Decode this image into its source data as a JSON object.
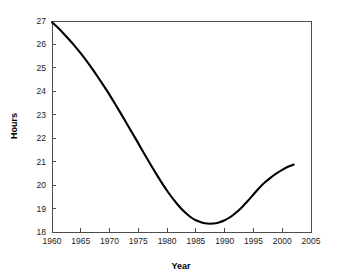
{
  "chart_data": {
    "type": "line",
    "title": "",
    "xlabel": "Year",
    "ylabel": "Hours",
    "xlim": [
      1960,
      2005
    ],
    "ylim": [
      18,
      27
    ],
    "grid": false,
    "legend": null,
    "xticks": [
      1960,
      1965,
      1970,
      1975,
      1980,
      1985,
      1990,
      1995,
      2000,
      2005
    ],
    "yticks": [
      18,
      19,
      20,
      21,
      22,
      23,
      24,
      25,
      26,
      27
    ],
    "xtick_labels": [
      "1960",
      "1965",
      "1970",
      "1975",
      "1980",
      "1985",
      "1990",
      "1995",
      "2000",
      "2005"
    ],
    "ytick_labels": [
      "18",
      "19",
      "20",
      "21",
      "22",
      "23",
      "24",
      "25",
      "26",
      "27"
    ],
    "series": [
      {
        "name": "Hours",
        "color": "#000000",
        "x": [
          1960,
          1961,
          1962,
          1963,
          1964,
          1965,
          1966,
          1967,
          1968,
          1969,
          1970,
          1971,
          1972,
          1973,
          1974,
          1975,
          1976,
          1977,
          1978,
          1979,
          1980,
          1981,
          1982,
          1983,
          1984,
          1985,
          1986,
          1987,
          1988,
          1989,
          1990,
          1991,
          1992,
          1993,
          1994,
          1995,
          1996,
          1997,
          1998,
          1999,
          2000,
          2001,
          2002
        ],
        "values": [
          26.95,
          26.72,
          26.47,
          26.2,
          25.92,
          25.62,
          25.3,
          24.96,
          24.6,
          24.23,
          23.85,
          23.45,
          23.04,
          22.62,
          22.2,
          21.78,
          21.35,
          20.93,
          20.52,
          20.13,
          19.76,
          19.42,
          19.12,
          18.86,
          18.65,
          18.5,
          18.41,
          18.36,
          18.36,
          18.41,
          18.5,
          18.64,
          18.83,
          19.06,
          19.32,
          19.6,
          19.88,
          20.12,
          20.32,
          20.5,
          20.65,
          20.78,
          20.88
        ]
      }
    ],
    "annotations": {
      "minimum_year": 1987.5,
      "minimum_value": 18.36,
      "start_value": 26.95,
      "end_value": 20.88
    }
  },
  "figure": {
    "background_color": "#ffffff",
    "axis_color": "#4d4d4d",
    "text_color": "#1a1a1a",
    "curve_color": "#000000"
  }
}
